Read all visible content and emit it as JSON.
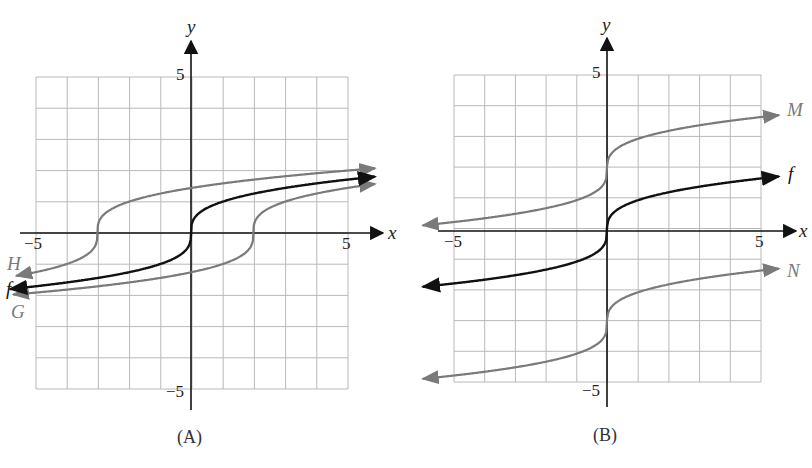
{
  "colors": {
    "primary": "#111111",
    "transformed": "#7a7a7a",
    "grid": "#b9b9b9"
  },
  "chart_data": [
    {
      "type": "line",
      "title": "(A)",
      "xlabel": "x",
      "ylabel": "y",
      "xlim": [
        -5,
        5
      ],
      "ylim": [
        -5,
        5
      ],
      "grid": true,
      "tick_labels": {
        "x": [
          "-5",
          "5"
        ],
        "y": [
          "5",
          "-5"
        ]
      },
      "series": [
        {
          "name": "f",
          "color": "#111111",
          "formula": "cbrt(x)",
          "x": [
            -6,
            -3,
            -1,
            0,
            1,
            3,
            6
          ],
          "values": [
            -1.82,
            -1.44,
            -1,
            0,
            1,
            1.44,
            1.82
          ]
        },
        {
          "name": "H",
          "color": "#7a7a7a",
          "formula": "cbrt(x+3)",
          "x": [
            -6,
            -4,
            -3,
            -2,
            0,
            3,
            6
          ],
          "values": [
            -1.44,
            -1,
            0,
            1,
            1.44,
            1.82,
            2.08
          ]
        },
        {
          "name": "G",
          "color": "#7a7a7a",
          "formula": "cbrt(x-2)",
          "x": [
            -6,
            -3,
            1,
            2,
            3,
            6
          ],
          "values": [
            -2.0,
            -1.71,
            -1,
            0,
            1,
            1.59
          ]
        }
      ],
      "labels": [
        "H",
        "f",
        "G"
      ]
    },
    {
      "type": "line",
      "title": "(B)",
      "xlabel": "x",
      "ylabel": "y",
      "xlim": [
        -5,
        5
      ],
      "ylim": [
        -5,
        5
      ],
      "grid": true,
      "tick_labels": {
        "x": [
          "-5",
          "5"
        ],
        "y": [
          "5",
          "-5"
        ]
      },
      "series": [
        {
          "name": "M",
          "color": "#7a7a7a",
          "formula": "cbrt(x)+2",
          "x": [
            -6,
            -1,
            0,
            1,
            6
          ],
          "values": [
            0.18,
            1,
            2,
            3,
            3.82
          ]
        },
        {
          "name": "f",
          "color": "#111111",
          "formula": "cbrt(x)",
          "x": [
            -6,
            -1,
            0,
            1,
            6
          ],
          "values": [
            -1.82,
            -1,
            0,
            1,
            1.82
          ]
        },
        {
          "name": "N",
          "color": "#7a7a7a",
          "formula": "cbrt(x)-3",
          "x": [
            -6,
            -1,
            0,
            1,
            6
          ],
          "values": [
            -4.82,
            -4,
            -3,
            -2,
            -1.18
          ]
        }
      ],
      "labels": [
        "M",
        "f",
        "N"
      ]
    }
  ],
  "panels": {
    "a": {
      "caption": "(A)",
      "x_label": "x",
      "y_label": "y",
      "tick_x_neg": "−5",
      "tick_x_pos": "5",
      "tick_y_pos": "5",
      "tick_y_neg": "−5",
      "curve_labels": {
        "H": "H",
        "f": "f",
        "G": "G"
      }
    },
    "b": {
      "caption": "(B)",
      "x_label": "x",
      "y_label": "y",
      "tick_x_neg": "−5",
      "tick_x_pos": "5",
      "tick_y_pos": "5",
      "tick_y_neg": "−5",
      "curve_labels": {
        "M": "M",
        "f": "f",
        "N": "N"
      }
    }
  }
}
